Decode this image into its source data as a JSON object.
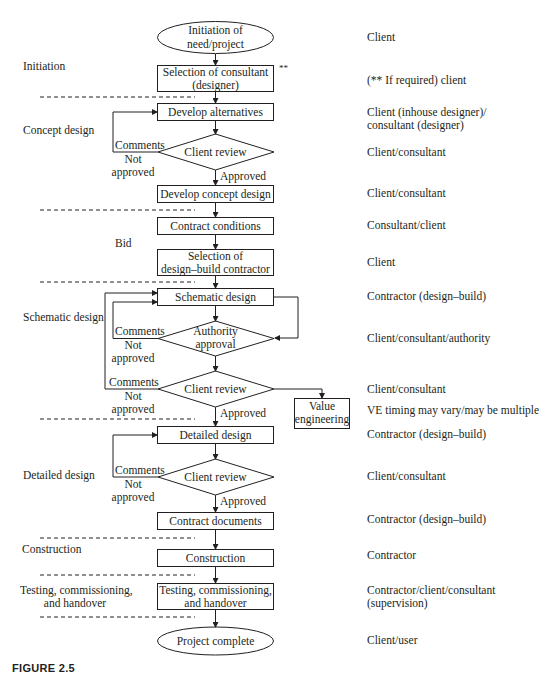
{
  "caption": "FIGURE 2.5",
  "nodes": {
    "start": "Initiation of need/project",
    "start_l1": "Initiation of",
    "start_l2": "need/project",
    "sel_consultant_l1": "Selection of consultant",
    "sel_consultant_l2": "(designer)",
    "sel_consultant_mark": "**",
    "develop_alternatives": "Develop alternatives",
    "client_review_1": "Client review",
    "develop_concept": "Develop concept design",
    "contract_conditions": "Contract conditions",
    "sel_db_l1": "Selection of",
    "sel_db_l2": "design–build contractor",
    "schematic_design": "Schematic design",
    "authority_l1": "Authority",
    "authority_l2": "approval",
    "client_review_2": "Client review",
    "value_eng_l1": "Value",
    "value_eng_l2": "engineering",
    "detailed_design": "Detailed design",
    "client_review_3": "Client review",
    "contract_documents": "Contract documents",
    "construction": "Construction",
    "testing_l1": "Testing, commissioning,",
    "testing_l2": "and handover",
    "end": "Project complete"
  },
  "edge_labels": {
    "comments": "Comments",
    "not": "Not",
    "approved_lc": "approved",
    "approved": "Approved"
  },
  "phases": {
    "initiation": "Initiation",
    "concept_design": "Concept design",
    "bid": "Bid",
    "schematic_design": "Schematic design",
    "detailed_design": "Detailed design",
    "construction": "Construction",
    "testing_l1": "Testing, commissioning,",
    "testing_l2": "and handover"
  },
  "responsibilities": {
    "start": "Client",
    "sel_consultant": "(** If required) client",
    "develop_alternatives_l1": "Client (inhouse designer)/",
    "develop_alternatives_l2": "consultant (designer)",
    "client_review_1": "Client/consultant",
    "develop_concept": "Client/consultant",
    "contract_conditions": "Consultant/client",
    "sel_db": "Client",
    "schematic_design": "Contractor (design–build)",
    "authority": "Client/consultant/authority",
    "client_review_2": "Client/consultant",
    "value_eng": "VE timing may vary/may be multiple",
    "detailed_design": "Contractor (design–build)",
    "client_review_3": "Client/consultant",
    "contract_documents": "Contractor (design–build)",
    "construction": "Contractor",
    "testing_l1": "Contractor/client/consultant",
    "testing_l2": "(supervision)",
    "end": "Client/user"
  },
  "colors": {
    "ink": "#231f20",
    "background": "#ffffff"
  }
}
